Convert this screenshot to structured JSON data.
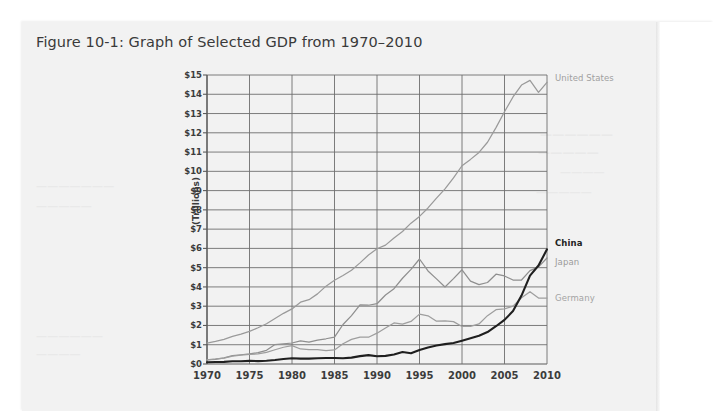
{
  "figure": {
    "title": "Figure 10-1: Graph of Selected GDP from 1970–2010"
  },
  "ghost_text": {
    "line1": "——————",
    "line2": "—————",
    "line3": "————",
    "line4": "—————",
    "line5": "———————",
    "line6": "—————",
    "line7": "——————",
    "line8": "————"
  },
  "chart_data": {
    "type": "line",
    "title": "Figure 10-1: Graph of Selected GDP from 1970–2010",
    "xlabel": "",
    "ylabel": "(Trillions)",
    "xlim": [
      1970,
      2010
    ],
    "ylim": [
      0,
      15
    ],
    "grid": true,
    "legend_position": "right-inline",
    "y_tick_labels": [
      "$15",
      "$14",
      "$13",
      "$12",
      "$11",
      "$10",
      "$9",
      "$8",
      "$7",
      "$6",
      "$5",
      "$4",
      "$3",
      "$2",
      "$1",
      "$0"
    ],
    "y_tick_values": [
      15,
      14,
      13,
      12,
      11,
      10,
      9,
      8,
      7,
      6,
      5,
      4,
      3,
      2,
      1,
      0
    ],
    "x_tick_labels": [
      "1970",
      "1975",
      "1980",
      "1985",
      "1990",
      "1995",
      "2000",
      "2005",
      "2010"
    ],
    "x_tick_values": [
      1970,
      1975,
      1980,
      1985,
      1990,
      1995,
      2000,
      2005,
      2010
    ],
    "x": [
      1970,
      1971,
      1972,
      1973,
      1974,
      1975,
      1976,
      1977,
      1978,
      1979,
      1980,
      1981,
      1982,
      1983,
      1984,
      1985,
      1986,
      1987,
      1988,
      1989,
      1990,
      1991,
      1992,
      1993,
      1994,
      1995,
      1996,
      1997,
      1998,
      1999,
      2000,
      2001,
      2002,
      2003,
      2004,
      2005,
      2006,
      2007,
      2008,
      2009,
      2010
    ],
    "series": [
      {
        "name": "United States",
        "color": "#9a9a9a",
        "emphasis": "normal",
        "label_color": "#a0a0a0",
        "label_bold": false,
        "values": [
          1.08,
          1.17,
          1.28,
          1.43,
          1.55,
          1.69,
          1.88,
          2.09,
          2.36,
          2.63,
          2.86,
          3.21,
          3.34,
          3.64,
          4.04,
          4.35,
          4.59,
          4.87,
          5.25,
          5.66,
          5.98,
          6.17,
          6.54,
          6.88,
          7.31,
          7.66,
          8.1,
          8.61,
          9.09,
          9.66,
          10.29,
          10.62,
          10.98,
          11.51,
          12.27,
          13.09,
          13.86,
          14.48,
          14.72,
          14.1,
          14.62
        ]
      },
      {
        "name": "Japan",
        "color": "#8f8f8f",
        "emphasis": "normal",
        "label_color": "#9b9b9b",
        "label_bold": false,
        "values": [
          0.21,
          0.24,
          0.32,
          0.43,
          0.48,
          0.52,
          0.59,
          0.71,
          1.01,
          1.05,
          1.09,
          1.2,
          1.13,
          1.24,
          1.31,
          1.4,
          2.05,
          2.51,
          3.07,
          3.05,
          3.13,
          3.58,
          3.91,
          4.45,
          4.91,
          5.45,
          4.83,
          4.42,
          4.0,
          4.43,
          4.89,
          4.3,
          4.12,
          4.23,
          4.66,
          4.57,
          4.36,
          4.36,
          4.85,
          5.04,
          5.5
        ]
      },
      {
        "name": "Germany",
        "color": "#9e9e9e",
        "emphasis": "normal",
        "label_color": "#a4a4a4",
        "label_bold": false,
        "values": [
          0.22,
          0.26,
          0.31,
          0.41,
          0.46,
          0.5,
          0.52,
          0.6,
          0.74,
          0.87,
          0.95,
          0.78,
          0.74,
          0.74,
          0.69,
          0.73,
          1.05,
          1.28,
          1.39,
          1.39,
          1.6,
          1.87,
          2.13,
          2.07,
          2.21,
          2.59,
          2.5,
          2.22,
          2.24,
          2.2,
          1.95,
          1.95,
          2.08,
          2.51,
          2.82,
          2.86,
          3.0,
          3.44,
          3.75,
          3.42,
          3.42
        ]
      },
      {
        "name": "China",
        "color": "#1f1f1f",
        "emphasis": "bold",
        "label_color": "#222222",
        "label_bold": true,
        "values": [
          0.09,
          0.1,
          0.11,
          0.14,
          0.14,
          0.16,
          0.15,
          0.17,
          0.21,
          0.26,
          0.3,
          0.28,
          0.28,
          0.3,
          0.31,
          0.31,
          0.3,
          0.33,
          0.41,
          0.46,
          0.4,
          0.42,
          0.49,
          0.62,
          0.56,
          0.73,
          0.86,
          0.96,
          1.03,
          1.09,
          1.21,
          1.34,
          1.47,
          1.66,
          1.96,
          2.29,
          2.75,
          3.55,
          4.59,
          5.11,
          5.95
        ]
      }
    ],
    "annotations": [
      {
        "text": "United States",
        "at_year": 2010,
        "at_value": 14.62
      },
      {
        "text": "China",
        "at_year": 2010,
        "at_value": 5.95
      },
      {
        "text": "Japan",
        "at_year": 2010,
        "at_value": 5.5
      },
      {
        "text": "Germany",
        "at_year": 2010,
        "at_value": 3.42
      }
    ]
  }
}
